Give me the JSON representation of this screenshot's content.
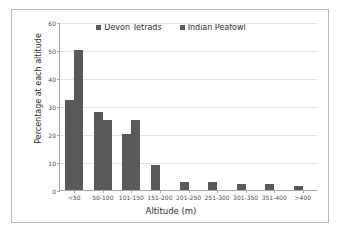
{
  "chart_data": {
    "type": "bar",
    "title": "",
    "xlabel": "Altitude (m)",
    "ylabel": "Percentage at each altitude",
    "categories": [
      "<50",
      "50-100",
      "101-150",
      "151-200",
      "201-250",
      "251-300",
      "301-350",
      "351-400",
      ">400"
    ],
    "series": [
      {
        "name": "Devon Tetrads",
        "color": "#595959",
        "values": [
          32,
          28,
          20,
          9,
          3,
          3,
          2,
          2,
          1.5
        ]
      },
      {
        "name": "Indian Peafowl",
        "color": "#595959",
        "values": [
          50,
          25,
          25,
          0,
          0,
          0,
          0,
          0,
          0
        ]
      }
    ],
    "ylim": [
      0,
      60
    ],
    "yticks": [
      0,
      10,
      20,
      30,
      40,
      50,
      60
    ],
    "ytick_labels": [
      "0",
      "10",
      "20",
      "30",
      "40",
      "50",
      "60"
    ],
    "grid": true,
    "legend_position": "top-center",
    "bar_color": "#595959",
    "gridline_color": "#e3e3e3",
    "axis_color": "#a6a6a6",
    "frame_color": "#b9b9b9",
    "background": "#ffffff"
  }
}
